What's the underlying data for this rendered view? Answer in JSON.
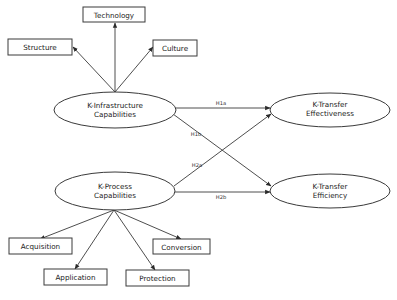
{
  "diagram": {
    "constructs": {
      "infrastructure": {
        "line1": "K-Infrastructure",
        "line2": "Capabilities"
      },
      "process": {
        "line1": "K-Process",
        "line2": "Capabilities"
      },
      "effectiveness": {
        "line1": "K-Transfer",
        "line2": "Effectiveness"
      },
      "efficiency": {
        "line1": "K-Transfer",
        "line2": "Efficiency"
      }
    },
    "infrastructure_dimensions": {
      "technology": "Technology",
      "structure": "Structure",
      "culture": "Culture"
    },
    "process_dimensions": {
      "acquisition": "Acquisition",
      "application": "Application",
      "protection": "Protection",
      "conversion": "Conversion"
    },
    "hypotheses": {
      "h1a": "H1a",
      "h1b": "H1b",
      "h2a": "H2a",
      "h2b": "H2b"
    },
    "colors": {
      "stroke": "#3a3a3a",
      "text": "#222222",
      "background": "#ffffff"
    }
  }
}
